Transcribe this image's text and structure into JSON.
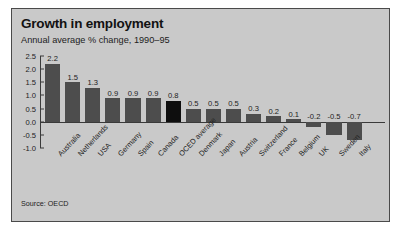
{
  "figure": {
    "title": "Growth in employment",
    "subtitle": "Annual average % change, 1990–95",
    "source": "Source: OECD",
    "panel_bg": "#c9c9c9",
    "border_color": "#4a4a4a",
    "bar_color": "#4d4d4d",
    "highlight_color": "#0e0e0e"
  },
  "chart_data": {
    "type": "bar",
    "title": "Growth in employment",
    "subtitle": "Annual average % change, 1990–95",
    "xlabel": "",
    "ylabel": "",
    "ylim": [
      -1.0,
      2.5
    ],
    "yticks": [
      2.5,
      2.0,
      1.5,
      1.0,
      0.5,
      0.0,
      -0.5,
      -1.0
    ],
    "ytick_labels": [
      "2.5",
      "2.0",
      "1.5",
      "1.0",
      "0.5",
      "0.0",
      "-0.5",
      "-1.0"
    ],
    "grid": false,
    "legend": null,
    "source": "Source: OECD",
    "highlight_category": "OCED average",
    "categories": [
      "Australia",
      "Netherlands",
      "USA",
      "Germany",
      "Spain",
      "Canada",
      "OCED average",
      "Denmark",
      "Japan",
      "Austria",
      "Switzerland",
      "France",
      "Belgium",
      "UK",
      "Sweden",
      "Italy"
    ],
    "values": [
      2.2,
      1.5,
      1.3,
      0.9,
      0.9,
      0.9,
      0.8,
      0.5,
      0.5,
      0.5,
      0.3,
      0.2,
      0.1,
      -0.2,
      -0.5,
      -0.7
    ],
    "value_labels": [
      "2.2",
      "1.5",
      "1.3",
      "0.9",
      "0.9",
      "0.9",
      "0.8",
      "0.5",
      "0.5",
      "0.5",
      "0.3",
      "0.2",
      "0.1",
      "-0.2",
      "-0.5",
      "-0.7"
    ]
  }
}
